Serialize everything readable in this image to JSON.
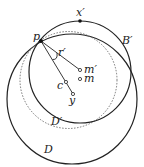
{
  "diagram": {
    "labels": {
      "x_prime": "x′",
      "p": "p",
      "b_prime": "B′",
      "r_prime": "r′",
      "m_prime": "m′",
      "m": "m",
      "c": "c",
      "y": "y",
      "d_prime": "D′",
      "d": "D"
    },
    "colors": {
      "stroke": "#222222",
      "dotted": "#555555"
    }
  }
}
